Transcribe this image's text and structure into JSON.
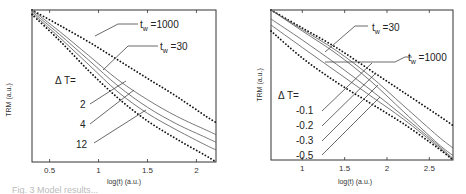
{
  "chart_data": [
    {
      "type": "line",
      "panel": "left",
      "xlabel": "log(t) (a.u.)",
      "ylabel": "TRM (a.u.)",
      "xlim": [
        0.32,
        2.2
      ],
      "ylim": [
        0,
        1
      ],
      "xticks": [
        0.5,
        1,
        1.5,
        2
      ],
      "xtick_labels": [
        "0.5",
        "1",
        "1.5",
        "2"
      ],
      "grid": false,
      "annotations": {
        "tw_high": {
          "t": "t",
          "sub": "w",
          "rest": " =1000"
        },
        "tw_low": {
          "t": "t",
          "sub": "w",
          "rest": " =30"
        },
        "delta_label": "Δ T=",
        "dT_values": [
          "2",
          "4",
          "12"
        ]
      },
      "series": [
        {
          "name": "t_w=1000",
          "style": "dotted",
          "x": [
            0.32,
            0.6,
            0.9,
            1.2,
            1.5,
            1.8,
            2.1,
            2.2
          ],
          "y": [
            1.0,
            0.9,
            0.79,
            0.67,
            0.55,
            0.43,
            0.3,
            0.26
          ]
        },
        {
          "name": "ΔT=2",
          "style": "solid",
          "x": [
            0.32,
            0.6,
            0.9,
            1.2,
            1.5,
            1.8,
            2.1,
            2.2
          ],
          "y": [
            1.0,
            0.86,
            0.7,
            0.54,
            0.41,
            0.3,
            0.21,
            0.18
          ]
        },
        {
          "name": "ΔT=4",
          "style": "solid",
          "x": [
            0.32,
            0.6,
            0.9,
            1.2,
            1.5,
            1.8,
            2.1,
            2.2
          ],
          "y": [
            0.99,
            0.84,
            0.67,
            0.5,
            0.36,
            0.25,
            0.16,
            0.13
          ]
        },
        {
          "name": "ΔT=12",
          "style": "solid",
          "x": [
            0.32,
            0.6,
            0.9,
            1.2,
            1.5,
            1.8,
            2.1,
            2.2
          ],
          "y": [
            0.98,
            0.82,
            0.64,
            0.46,
            0.32,
            0.21,
            0.11,
            0.08
          ]
        },
        {
          "name": "t_w=30",
          "style": "dotted",
          "x": [
            0.32,
            0.6,
            0.9,
            1.2,
            1.5,
            1.8,
            2.1,
            2.2
          ],
          "y": [
            0.97,
            0.8,
            0.6,
            0.42,
            0.27,
            0.15,
            0.04,
            0.0
          ]
        }
      ]
    },
    {
      "type": "line",
      "panel": "right",
      "xlabel": "log(t) (a.u.)",
      "ylabel": "TRM (a.u.)",
      "xlim": [
        0.63,
        2.78
      ],
      "ylim": [
        0,
        1
      ],
      "xticks": [
        1,
        1.5,
        2,
        2.5
      ],
      "xtick_labels": [
        "1",
        "1.5",
        "2",
        "2.5"
      ],
      "grid": false,
      "annotations": {
        "tw_low": {
          "t": "t",
          "sub": "w",
          "rest": " =30"
        },
        "tw_high": {
          "t": "t",
          "sub": "w",
          "rest": " =1000"
        },
        "delta_label": "Δ T=",
        "dT_values": [
          "-0.1",
          "-0.2",
          "-0.3",
          "-0.5"
        ]
      },
      "series": [
        {
          "name": "t_w=1000",
          "style": "dotted",
          "x": [
            0.63,
            1.0,
            1.4,
            1.8,
            2.2,
            2.6,
            2.78
          ],
          "y": [
            1.0,
            0.88,
            0.75,
            0.6,
            0.45,
            0.3,
            0.23
          ]
        },
        {
          "name": "ΔT=-0.1",
          "style": "solid",
          "x": [
            0.63,
            1.0,
            1.4,
            1.8,
            2.2,
            2.6,
            2.78
          ],
          "y": [
            1.0,
            0.87,
            0.73,
            0.56,
            0.36,
            0.16,
            0.08
          ]
        },
        {
          "name": "ΔT=-0.2",
          "style": "solid",
          "x": [
            0.63,
            1.0,
            1.4,
            1.8,
            2.2,
            2.6,
            2.78
          ],
          "y": [
            1.0,
            0.86,
            0.71,
            0.53,
            0.32,
            0.11,
            0.03
          ]
        },
        {
          "name": "ΔT=-0.3",
          "style": "solid",
          "x": [
            0.63,
            1.0,
            1.4,
            1.8,
            2.2,
            2.6,
            2.78
          ],
          "y": [
            0.94,
            0.8,
            0.64,
            0.47,
            0.29,
            0.1,
            0.01
          ]
        },
        {
          "name": "ΔT=-0.5",
          "style": "solid",
          "x": [
            0.63,
            1.0,
            1.4,
            1.8,
            2.2,
            2.6,
            2.78
          ],
          "y": [
            0.9,
            0.75,
            0.59,
            0.43,
            0.27,
            0.09,
            0.0
          ]
        },
        {
          "name": "t_w=30",
          "style": "dotted",
          "x": [
            0.63,
            1.0,
            1.4,
            1.8,
            2.2,
            2.6,
            2.78
          ],
          "y": [
            0.86,
            0.68,
            0.52,
            0.38,
            0.24,
            0.08,
            0.0
          ]
        }
      ]
    }
  ],
  "caption_fragment": "Fig. 3  Model results..."
}
